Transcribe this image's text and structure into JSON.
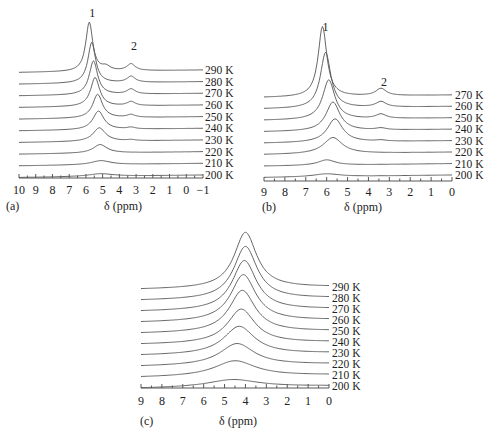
{
  "chart_data": [
    {
      "id": "a",
      "type": "line",
      "panel_label": "(a)",
      "xlabel": "δ (ppm)",
      "xlim": [
        10,
        -1
      ],
      "xticks": [
        "10",
        "9",
        "8",
        "7",
        "6",
        "5",
        "4",
        "3",
        "2",
        "1",
        "0",
        "−1"
      ],
      "xtick_values": [
        10,
        9,
        8,
        7,
        6,
        5,
        4,
        3,
        2,
        1,
        0,
        -1
      ],
      "peak_annotations": [
        {
          "label": "1",
          "ppm": 5.8
        },
        {
          "label": "2",
          "ppm": 3.3
        }
      ],
      "series": [
        {
          "name": "200 K",
          "peaks": [
            {
              "ppm": 5.1,
              "height": 0.08,
              "width": 1.8
            }
          ]
        },
        {
          "name": "210 K",
          "peaks": [
            {
              "ppm": 5.1,
              "height": 0.12,
              "width": 1.4
            }
          ]
        },
        {
          "name": "220 K",
          "peaks": [
            {
              "ppm": 5.15,
              "height": 0.25,
              "width": 1.0
            }
          ]
        },
        {
          "name": "230 K",
          "peaks": [
            {
              "ppm": 5.2,
              "height": 0.4,
              "width": 0.9
            },
            {
              "ppm": 3.3,
              "height": 0.03,
              "width": 0.6
            }
          ]
        },
        {
          "name": "240 K",
          "peaks": [
            {
              "ppm": 5.25,
              "height": 0.55,
              "width": 0.8
            },
            {
              "ppm": 3.3,
              "height": 0.05,
              "width": 0.6
            }
          ]
        },
        {
          "name": "250 K",
          "peaks": [
            {
              "ppm": 5.3,
              "height": 0.7,
              "width": 0.7
            },
            {
              "ppm": 3.3,
              "height": 0.08,
              "width": 0.6
            }
          ]
        },
        {
          "name": "260 K",
          "peaks": [
            {
              "ppm": 5.45,
              "height": 0.85,
              "width": 0.65
            },
            {
              "ppm": 3.3,
              "height": 0.12,
              "width": 0.6
            }
          ]
        },
        {
          "name": "270 K",
          "peaks": [
            {
              "ppm": 5.55,
              "height": 1.0,
              "width": 0.6
            },
            {
              "ppm": 3.3,
              "height": 0.15,
              "width": 0.6
            }
          ]
        },
        {
          "name": "280 K",
          "peaks": [
            {
              "ppm": 5.65,
              "height": 1.2,
              "width": 0.55
            },
            {
              "ppm": 3.3,
              "height": 0.18,
              "width": 0.6
            }
          ]
        },
        {
          "name": "290 K",
          "peaks": [
            {
              "ppm": 5.8,
              "height": 1.45,
              "width": 0.5
            },
            {
              "ppm": 4.8,
              "height": 0.12,
              "width": 0.6
            },
            {
              "ppm": 3.3,
              "height": 0.2,
              "width": 0.6
            }
          ]
        }
      ]
    },
    {
      "id": "b",
      "type": "line",
      "panel_label": "(b)",
      "xlabel": "δ (ppm)",
      "xlim": [
        9,
        0
      ],
      "xticks": [
        "9",
        "8",
        "7",
        "6",
        "5",
        "4",
        "3",
        "2",
        "1",
        "0"
      ],
      "xtick_values": [
        9,
        8,
        7,
        6,
        5,
        4,
        3,
        2,
        1,
        0
      ],
      "peak_annotations": [
        {
          "label": "1",
          "ppm": 6.2
        },
        {
          "label": "2",
          "ppm": 3.4
        }
      ],
      "series": [
        {
          "name": "200 K",
          "peaks": [
            {
              "ppm": 6.0,
              "height": 0.08,
              "width": 1.5
            }
          ]
        },
        {
          "name": "210 K",
          "peaks": [
            {
              "ppm": 6.0,
              "height": 0.15,
              "width": 1.0
            }
          ]
        },
        {
          "name": "220 K",
          "peaks": [
            {
              "ppm": 5.7,
              "height": 0.45,
              "width": 1.1
            }
          ]
        },
        {
          "name": "230 K",
          "peaks": [
            {
              "ppm": 5.6,
              "height": 0.65,
              "width": 0.9
            },
            {
              "ppm": 3.4,
              "height": 0.03,
              "width": 0.6
            }
          ]
        },
        {
          "name": "240 K",
          "peaks": [
            {
              "ppm": 5.7,
              "height": 0.8,
              "width": 0.8
            },
            {
              "ppm": 3.4,
              "height": 0.05,
              "width": 0.6
            }
          ]
        },
        {
          "name": "250 K",
          "peaks": [
            {
              "ppm": 5.9,
              "height": 1.1,
              "width": 0.7
            },
            {
              "ppm": 3.4,
              "height": 0.12,
              "width": 0.6
            }
          ]
        },
        {
          "name": "260 K",
          "peaks": [
            {
              "ppm": 6.05,
              "height": 1.55,
              "width": 0.6
            },
            {
              "ppm": 3.4,
              "height": 0.15,
              "width": 0.6
            }
          ]
        },
        {
          "name": "270 K",
          "peaks": [
            {
              "ppm": 6.2,
              "height": 1.95,
              "width": 0.5
            },
            {
              "ppm": 3.4,
              "height": 0.2,
              "width": 0.6
            }
          ]
        }
      ]
    },
    {
      "id": "c",
      "type": "line",
      "panel_label": "(c)",
      "xlabel": "δ (ppm)",
      "xlim": [
        9,
        0
      ],
      "xticks": [
        "9",
        "8",
        "7",
        "6",
        "5",
        "4",
        "3",
        "2",
        "1",
        "0"
      ],
      "xtick_values": [
        9,
        8,
        7,
        6,
        5,
        4,
        3,
        2,
        1,
        0
      ],
      "peak_annotations": [],
      "series": [
        {
          "name": "200 K",
          "peaks": [
            {
              "ppm": 4.6,
              "height": 0.25,
              "width": 3.0
            }
          ]
        },
        {
          "name": "210 K",
          "peaks": [
            {
              "ppm": 4.5,
              "height": 0.5,
              "width": 2.4
            }
          ]
        },
        {
          "name": "220 K",
          "peaks": [
            {
              "ppm": 4.4,
              "height": 0.7,
              "width": 2.0
            }
          ]
        },
        {
          "name": "230 K",
          "peaks": [
            {
              "ppm": 4.3,
              "height": 0.9,
              "width": 1.8
            }
          ]
        },
        {
          "name": "240 K",
          "peaks": [
            {
              "ppm": 4.2,
              "height": 1.1,
              "width": 1.6
            }
          ]
        },
        {
          "name": "250 K",
          "peaks": [
            {
              "ppm": 4.15,
              "height": 1.35,
              "width": 1.5
            }
          ]
        },
        {
          "name": "260 K",
          "peaks": [
            {
              "ppm": 4.1,
              "height": 1.5,
              "width": 1.45
            }
          ]
        },
        {
          "name": "270 K",
          "peaks": [
            {
              "ppm": 4.05,
              "height": 1.6,
              "width": 1.4
            }
          ]
        },
        {
          "name": "280 K",
          "peaks": [
            {
              "ppm": 4.0,
              "height": 1.7,
              "width": 1.35
            }
          ]
        },
        {
          "name": "290 K",
          "peaks": [
            {
              "ppm": 4.0,
              "height": 1.8,
              "width": 1.3
            }
          ]
        }
      ]
    }
  ]
}
